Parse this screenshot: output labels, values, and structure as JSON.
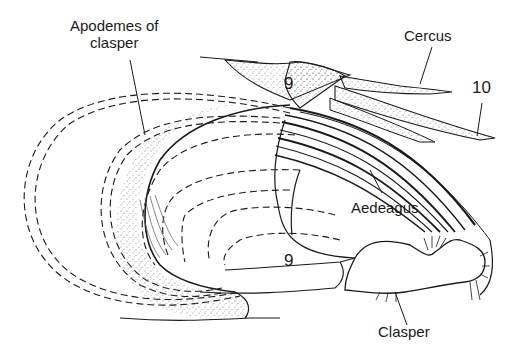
{
  "diagram": {
    "labels": {
      "apodemes": [
        "Apodemes of",
        "clasper"
      ],
      "cercus": "Cercus",
      "segment10": "10",
      "segment9_top": "9",
      "aedeagus": "Aedeagus",
      "segment9_bottom": "9",
      "clasper": "Clasper"
    },
    "colors": {
      "ink": "#1a1a1a",
      "background": "#ffffff",
      "stipple": "#8a8a8a"
    }
  }
}
